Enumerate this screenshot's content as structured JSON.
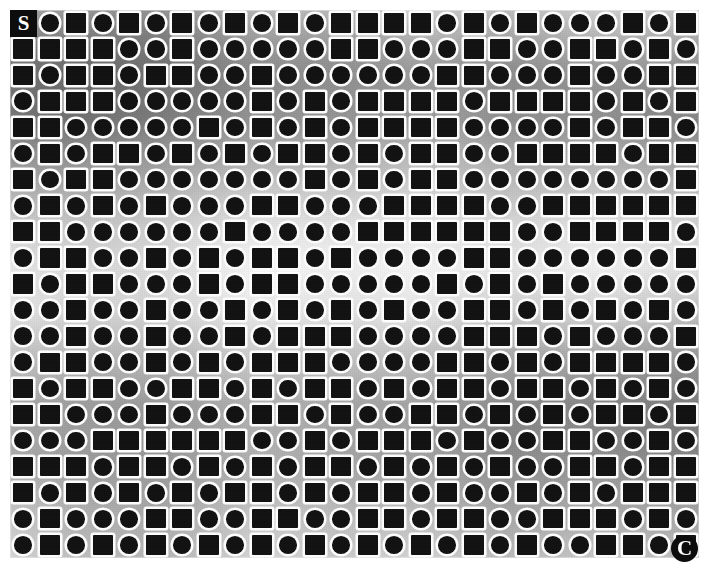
{
  "figure": {
    "marker_top_left": "S",
    "marker_bottom_right": "C",
    "shape_fill_color": "#111111",
    "shape_outline_color": "#ffffff",
    "page_background": "#ffffff"
  },
  "grid": {
    "columns": 26,
    "rows": 21,
    "cell_size_px": 26,
    "square_token": "s",
    "circle_token": "c",
    "left_px": 10,
    "top_px": 10,
    "width_px": 689,
    "height_px": 548
  },
  "chart_data": {
    "type": "heatmap",
    "xlabel": "",
    "ylabel": "",
    "legend": [
      "s = dark square with white outline",
      "c = dark circle with white outline"
    ],
    "categories": [
      "col1",
      "col2",
      "col3",
      "col4",
      "col5",
      "col6",
      "col7",
      "col8",
      "col9",
      "col10",
      "col11",
      "col12",
      "col13",
      "col14",
      "col15",
      "col16",
      "col17",
      "col18",
      "col19",
      "col20",
      "col21",
      "col22",
      "col23",
      "col24",
      "col25",
      "col26"
    ],
    "rows": [
      "scscscscscscsssscscscccscsc",
      "ssssccscccccsscccssccsscscs",
      "scsscssccsccccccsscccsccssc",
      "cssscccccscscsssscsssscscsc",
      "sscccccscscscssssccccscsscc",
      "cscsscscscsscscssccsssscsss",
      "scsscccccccscscssccccccccsc",
      "cscscscccsscccssssccsssssss",
      "ssccccccsccccssssssccsssscs",
      "cssccscscsscsccccssccccccss",
      "scsscccscsscccccscscscccccs",
      "ccsccsccscscscsccsscscscscs",
      "ccsccsccscsssccccssscscccsc",
      "cssccscscsssccccsscscsssscc",
      "scssccsscscsscscsscsscscscs",
      "sscccscccsscsccsscscscsscsc",
      "cccssssssccscssscsccssccscc",
      "ssscsscscscsscscscsccsscssc",
      "scscscscsscscsscsccscscssss",
      "cscccssccssccsscssccssscscc",
      "cscscscscscscscscscsccsscsc"
    ],
    "grid_on": false,
    "xlim": [
      0,
      26
    ],
    "ylim": [
      0,
      21
    ]
  }
}
